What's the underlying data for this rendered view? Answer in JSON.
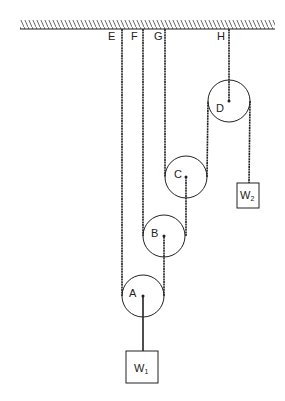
{
  "diagram": {
    "type": "pulley-system",
    "ceiling": {
      "x1": 20,
      "x2": 275,
      "y": 29,
      "hatch_top": 20
    },
    "anchors": [
      {
        "id": "E",
        "label": "E",
        "x": 122,
        "label_x": 110
      },
      {
        "id": "F",
        "label": "F",
        "x": 143,
        "label_x": 134
      },
      {
        "id": "G",
        "label": "G",
        "x": 165,
        "label_x": 157
      },
      {
        "id": "H",
        "label": "H",
        "x": 229,
        "label_x": 219
      }
    ],
    "pulleys": [
      {
        "id": "A",
        "label": "A",
        "cx": 143,
        "cy": 296,
        "r": 21,
        "label_x": 131,
        "label_y": 296
      },
      {
        "id": "B",
        "label": "B",
        "cx": 164,
        "cy": 236,
        "r": 21,
        "label_x": 153,
        "label_y": 236
      },
      {
        "id": "C",
        "label": "C",
        "cx": 186,
        "cy": 177,
        "r": 21,
        "label_x": 175,
        "label_y": 177
      },
      {
        "id": "D",
        "label": "D",
        "cx": 229,
        "cy": 101,
        "r": 21,
        "label_x": 217,
        "label_y": 111
      }
    ],
    "weights": [
      {
        "id": "W1",
        "label": "W",
        "subscript": "1",
        "x": 126,
        "y": 351,
        "w": 32,
        "h": 32
      },
      {
        "id": "W2",
        "label": "W",
        "subscript": "2",
        "x": 237,
        "y": 183,
        "w": 22,
        "h": 25
      }
    ],
    "line_color": "#222222"
  }
}
